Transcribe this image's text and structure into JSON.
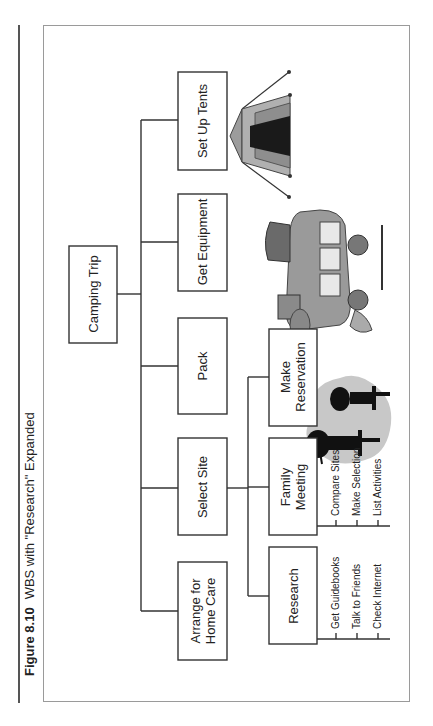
{
  "caption": {
    "figure_number": "Figure 8.10",
    "title": "WBS with \"Research\" Expanded"
  },
  "wbs": {
    "root": {
      "label": "Camping Trip"
    },
    "level2": [
      {
        "label": "Set Up Tents"
      },
      {
        "label": "Get Equipment"
      },
      {
        "label": "Pack"
      },
      {
        "label": "Select Site"
      },
      {
        "label": "Arrange for Home Care",
        "lines": [
          "Arrange for",
          "Home Care"
        ]
      }
    ],
    "level3": [
      {
        "label": "Make Reservation",
        "lines": [
          "Make",
          "Reservation"
        ]
      },
      {
        "label": "Family Meeting",
        "lines": [
          "Family",
          "Meeting"
        ]
      },
      {
        "label": "Research"
      }
    ],
    "family_meeting_tasks": [
      "Compare Sites",
      "Make Selection",
      "List Activities"
    ],
    "research_tasks": [
      "Get Guidebooks",
      "Talk to Friends",
      "Check Internet"
    ]
  },
  "illustrations": [
    "tent-clipart",
    "loaded-car-clipart",
    "family-silhouette-clipart"
  ],
  "colors": {
    "line": "#333333",
    "frame": "#9a9a9a",
    "tent_light": "#a8a8a8",
    "tent_dark": "#1a1a1a",
    "silhouette_bg": "#c8c8c8"
  }
}
